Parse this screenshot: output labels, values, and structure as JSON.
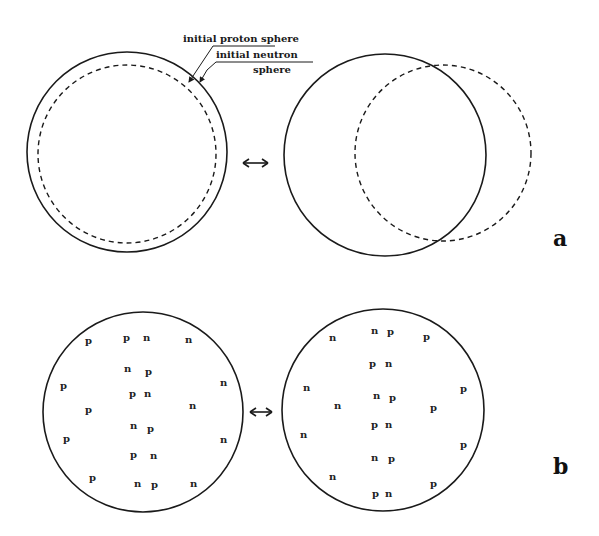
{
  "colors": {
    "ink": "#1a1a1a",
    "background": "#ffffff"
  },
  "panel_a": {
    "label": "a",
    "annotations": {
      "proton": "initial proton sphere",
      "neutron_line1": "initial neutron",
      "neutron_line2": "sphere"
    },
    "left": {
      "proton_circle": {
        "cx": 127,
        "cy": 152,
        "r": 100
      },
      "neutron_circle": {
        "cx": 127,
        "cy": 154,
        "r": 89
      }
    },
    "right": {
      "proton_circle": {
        "cx": 385,
        "cy": 155,
        "r": 101
      },
      "neutron_circle": {
        "cx": 443,
        "cy": 153,
        "r": 88
      }
    },
    "arrow": "↔"
  },
  "panel_b": {
    "label": "b",
    "arrow": "↔",
    "left": {
      "circle": {
        "cx": 143,
        "cy": 412,
        "r": 100
      },
      "nucleons": [
        {
          "t": "p",
          "x": 88,
          "y": 344
        },
        {
          "t": "p",
          "x": 126,
          "y": 341
        },
        {
          "t": "n",
          "x": 146,
          "y": 341
        },
        {
          "t": "n",
          "x": 188,
          "y": 343
        },
        {
          "t": "n",
          "x": 127,
          "y": 372
        },
        {
          "t": "p",
          "x": 148,
          "y": 375
        },
        {
          "t": "p",
          "x": 63,
          "y": 389
        },
        {
          "t": "n",
          "x": 223,
          "y": 386
        },
        {
          "t": "p",
          "x": 132,
          "y": 397
        },
        {
          "t": "n",
          "x": 147,
          "y": 397
        },
        {
          "t": "p",
          "x": 88,
          "y": 413
        },
        {
          "t": "n",
          "x": 192,
          "y": 409
        },
        {
          "t": "n",
          "x": 133,
          "y": 429
        },
        {
          "t": "p",
          "x": 150,
          "y": 432
        },
        {
          "t": "p",
          "x": 66,
          "y": 442
        },
        {
          "t": "n",
          "x": 223,
          "y": 443
        },
        {
          "t": "p",
          "x": 133,
          "y": 458
        },
        {
          "t": "n",
          "x": 153,
          "y": 459
        },
        {
          "t": "p",
          "x": 92,
          "y": 481
        },
        {
          "t": "n",
          "x": 137,
          "y": 487
        },
        {
          "t": "p",
          "x": 154,
          "y": 488
        },
        {
          "t": "n",
          "x": 193,
          "y": 487
        }
      ]
    },
    "right": {
      "circle": {
        "cx": 383,
        "cy": 410,
        "r": 101
      },
      "nucleons": [
        {
          "t": "n",
          "x": 332,
          "y": 341
        },
        {
          "t": "n",
          "x": 374,
          "y": 334
        },
        {
          "t": "p",
          "x": 390,
          "y": 335
        },
        {
          "t": "p",
          "x": 426,
          "y": 340
        },
        {
          "t": "p",
          "x": 372,
          "y": 367
        },
        {
          "t": "n",
          "x": 388,
          "y": 367
        },
        {
          "t": "n",
          "x": 306,
          "y": 391
        },
        {
          "t": "p",
          "x": 463,
          "y": 392
        },
        {
          "t": "n",
          "x": 376,
          "y": 399
        },
        {
          "t": "p",
          "x": 392,
          "y": 401
        },
        {
          "t": "n",
          "x": 337,
          "y": 409
        },
        {
          "t": "p",
          "x": 433,
          "y": 411
        },
        {
          "t": "p",
          "x": 374,
          "y": 428
        },
        {
          "t": "n",
          "x": 388,
          "y": 428
        },
        {
          "t": "n",
          "x": 303,
          "y": 438
        },
        {
          "t": "p",
          "x": 463,
          "y": 448
        },
        {
          "t": "n",
          "x": 374,
          "y": 461
        },
        {
          "t": "p",
          "x": 391,
          "y": 462
        },
        {
          "t": "n",
          "x": 332,
          "y": 480
        },
        {
          "t": "p",
          "x": 433,
          "y": 487
        },
        {
          "t": "p",
          "x": 375,
          "y": 497
        },
        {
          "t": "n",
          "x": 388,
          "y": 497
        }
      ]
    }
  }
}
